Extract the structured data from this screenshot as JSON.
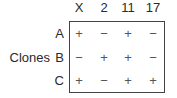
{
  "columns": [
    "X",
    "2",
    "11",
    "17"
  ],
  "row_group_label": "Clones",
  "rows": [
    {
      "label": "A",
      "values": [
        "+",
        "−",
        "+",
        "−"
      ]
    },
    {
      "label": "B",
      "values": [
        "−",
        "+",
        "+",
        "−"
      ]
    },
    {
      "label": "C",
      "values": [
        "+",
        "−",
        "+",
        "+"
      ]
    }
  ]
}
